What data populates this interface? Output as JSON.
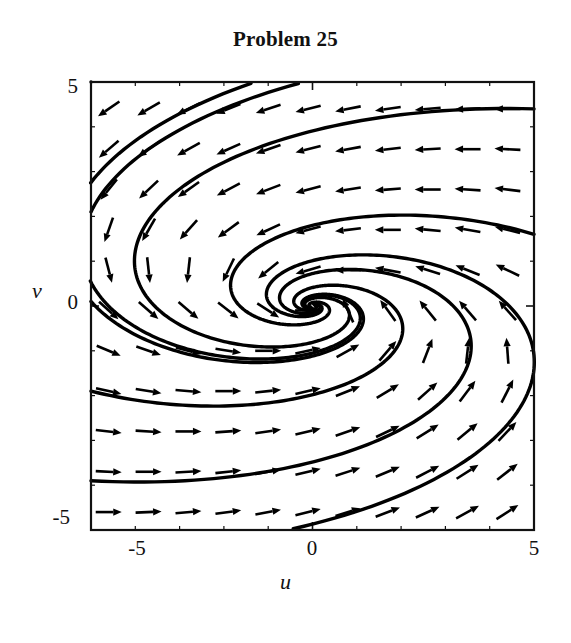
{
  "figure": {
    "title": "Problem 25",
    "background_color": "#ffffff",
    "ink_color": "#000000"
  },
  "axes": {
    "x_label": "u",
    "y_label": "v",
    "x_ticks": [
      "-5",
      "0",
      "5"
    ],
    "y_ticks": [
      "5",
      "0",
      "-5"
    ],
    "x_tick_minus5": "-5",
    "x_tick_0": "0",
    "x_tick_5": "5",
    "y_tick_5": "5",
    "y_tick_0": "0",
    "y_tick_minus5": "-5"
  },
  "chart_data": {
    "type": "scatter",
    "subtype": "phase-portrait-direction-field",
    "title": "Problem 25",
    "xlabel": "u",
    "ylabel": "v",
    "xlim": [
      -5,
      5
    ],
    "ylim": [
      -5,
      5
    ],
    "grid": false,
    "legend": "none",
    "xticks": [
      -5,
      0,
      5
    ],
    "yticks": [
      -5,
      0,
      5
    ],
    "minor_tick_step": 1,
    "equilibrium": {
      "u": 0,
      "v": 0,
      "classification": "stable spiral (spiral sink)"
    },
    "system": {
      "du_dt": "-u - 4*v",
      "dv_dt": "u - v",
      "matrix": [
        [
          -1,
          -4
        ],
        [
          1,
          -1
        ]
      ],
      "eigen_real_part": -1,
      "eigen_imag_part": 2,
      "rotation": "counterclockwise"
    },
    "vector_field": {
      "arrow_grid_x": [
        -4.6,
        -3.7,
        -2.8,
        -1.9,
        -1.0,
        -0.1,
        0.8,
        1.7,
        2.6,
        3.5,
        4.4
      ],
      "arrow_grid_y": [
        -4.6,
        -3.7,
        -2.8,
        -1.9,
        -1.0,
        -0.1,
        0.8,
        1.7,
        2.6,
        3.5,
        4.4
      ],
      "normalized": true,
      "arrow_length_px": 26
    },
    "trajectories": {
      "count": 8,
      "start_points": [
        [
          -5.0,
          5.0
        ],
        [
          -5.0,
          2.1
        ],
        [
          -5.0,
          0.1
        ],
        [
          -5.0,
          -1.9
        ],
        [
          -5.0,
          -3.9
        ],
        [
          5.0,
          4.4
        ],
        [
          5.0,
          1.6
        ],
        [
          5.0,
          -1.4
        ]
      ],
      "description": "Eight solution curves spiralling counterclockwise inward to the origin"
    }
  }
}
